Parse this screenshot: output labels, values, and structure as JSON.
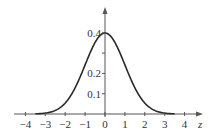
{
  "chart_data": {
    "type": "line",
    "title": "",
    "xlabel": "z",
    "ylabel": "",
    "x_ticks": [
      -4,
      -3,
      -2,
      -1,
      0,
      1,
      2,
      3,
      4
    ],
    "x_tick_labels": [
      "−4",
      "−3",
      "−2",
      "−1",
      "0",
      "1",
      "2",
      "3",
      "4"
    ],
    "y_ticks": [
      0.1,
      0.2,
      0.3,
      0.4
    ],
    "y_tick_labels": [
      "0.1",
      "0.2",
      "",
      "0.4"
    ],
    "xlim": [
      -4.5,
      4.8
    ],
    "ylim": [
      0,
      0.48
    ],
    "grid": false,
    "series": [
      {
        "name": "Standard normal density",
        "x": [
          -3.5,
          -3,
          -2.5,
          -2,
          -1.5,
          -1,
          -0.5,
          0,
          0.5,
          1,
          1.5,
          2,
          2.5,
          3,
          3.5
        ],
        "values": [
          0.0009,
          0.0044,
          0.0175,
          0.054,
          0.1295,
          0.242,
          0.3521,
          0.3989,
          0.3521,
          0.242,
          0.1295,
          0.054,
          0.0175,
          0.0044,
          0.0009
        ]
      }
    ],
    "colors": {
      "axis": "#555555",
      "curve": "#2a2a2a"
    }
  }
}
